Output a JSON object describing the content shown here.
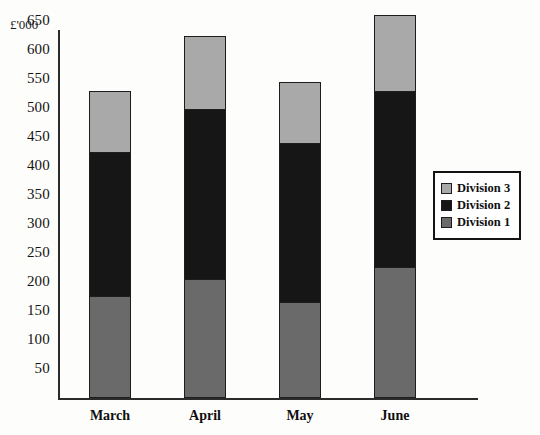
{
  "chart_data": {
    "type": "bar",
    "subtype": "stacked-bar",
    "title": "",
    "xlabel": "",
    "ylabel": "£'000",
    "unit_caption": "£'000",
    "categories": [
      "March",
      "April",
      "May",
      "June"
    ],
    "series": [
      {
        "name": "Division 1",
        "color": "#6a6a6a",
        "values": [
          175,
          205,
          165,
          225
        ]
      },
      {
        "name": "Division 2",
        "color": "#161616",
        "values": [
          250,
          295,
          275,
          305
        ]
      },
      {
        "name": "Division 3",
        "color": "#a9a9a9",
        "values": [
          105,
          125,
          105,
          130
        ]
      }
    ],
    "stack_order_bottom_to_top": [
      "Division 1",
      "Division 2",
      "Division 3"
    ],
    "cumulative_tops": {
      "March": {
        "Division 1": 175,
        "Division 2": 425,
        "Division 3": 530
      },
      "April": {
        "Division 1": 205,
        "Division 2": 500,
        "Division 3": 625
      },
      "May": {
        "Division 1": 165,
        "Division 2": 440,
        "Division 3": 545
      },
      "June": {
        "Division 1": 225,
        "Division 2": 530,
        "Division 3": 660
      }
    },
    "totals": [
      530,
      625,
      545,
      660
    ],
    "ylim": [
      0,
      675
    ],
    "ytick_values": [
      50,
      100,
      150,
      200,
      250,
      300,
      350,
      400,
      450,
      500,
      550,
      600,
      650
    ],
    "ytick_labels": [
      "50",
      "100",
      "150",
      "200",
      "250",
      "300",
      "350",
      "400",
      "450",
      "500",
      "550",
      "600",
      "650"
    ],
    "grid": false,
    "legend_position": "right"
  },
  "legend": {
    "items": [
      {
        "label": "Division 3",
        "color": "#a9a9a9"
      },
      {
        "label": "Division 2",
        "color": "#161616"
      },
      {
        "label": "Division 1",
        "color": "#6a6a6a"
      }
    ]
  },
  "colors": {
    "division_1": "#6a6a6a",
    "division_2": "#161616",
    "division_3": "#a9a9a9",
    "axis": "#2b2b2b",
    "text": "#121212",
    "background": "#fdfdfc"
  }
}
